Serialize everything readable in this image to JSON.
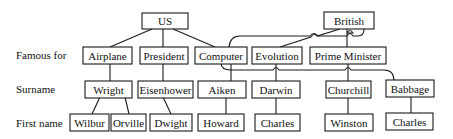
{
  "row_labels": {
    "famous_for": "Famous for",
    "surname": "Surname",
    "first_name": "First name"
  },
  "nodes": {
    "us": "US",
    "british": "British",
    "airplane": "Airplane",
    "president": "President",
    "computer": "Computer",
    "evolution": "Evolution",
    "prime_minister": "Prime Minister",
    "wright": "Wright",
    "eisenhower": "Eisenhower",
    "aiken": "Aiken",
    "darwin": "Darwin",
    "churchill": "Churchill",
    "babbage": "Babbage",
    "wilbur": "Wilbur",
    "orville": "Orville",
    "dwight": "Dwight",
    "howard": "Howard",
    "charles_darwin": "Charles",
    "winston": "Winston",
    "charles_babbage": "Charles"
  },
  "edges": [
    [
      "US",
      "Airplane"
    ],
    [
      "US",
      "President"
    ],
    [
      "US",
      "Computer"
    ],
    [
      "British",
      "Evolution"
    ],
    [
      "British",
      "Prime Minister"
    ],
    [
      "British",
      "Computer"
    ],
    [
      "Airplane",
      "Wright"
    ],
    [
      "President",
      "Eisenhower"
    ],
    [
      "Computer",
      "Aiken"
    ],
    [
      "Evolution",
      "Darwin"
    ],
    [
      "Prime Minister",
      "Churchill"
    ],
    [
      "Computer",
      "Babbage"
    ],
    [
      "Wright",
      "Wilbur"
    ],
    [
      "Wright",
      "Orville"
    ],
    [
      "Eisenhower",
      "Dwight"
    ],
    [
      "Aiken",
      "Howard"
    ],
    [
      "Darwin",
      "Charles"
    ],
    [
      "Churchill",
      "Winston"
    ],
    [
      "Babbage",
      "Charles"
    ]
  ]
}
